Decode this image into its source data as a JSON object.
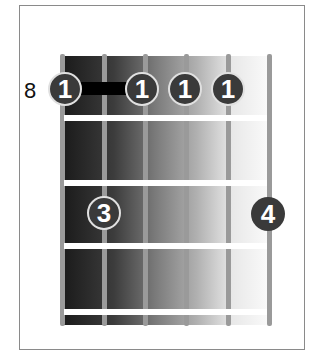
{
  "diagram": {
    "type": "guitar-chord-diagram",
    "start_fret_label": "8",
    "strings": 6,
    "frets_shown": 4,
    "barre": {
      "finger": "1",
      "fret": 1,
      "from_string": 1,
      "to_string": 5
    },
    "fingers": [
      {
        "label": "1",
        "string": 1,
        "fret": 1
      },
      {
        "label": "1",
        "string": 3,
        "fret": 1
      },
      {
        "label": "1",
        "string": 4,
        "fret": 1
      },
      {
        "label": "1",
        "string": 5,
        "fret": 1
      },
      {
        "label": "3",
        "string": 2,
        "fret": 3
      },
      {
        "label": "4",
        "string": 6,
        "fret": 3
      }
    ]
  }
}
